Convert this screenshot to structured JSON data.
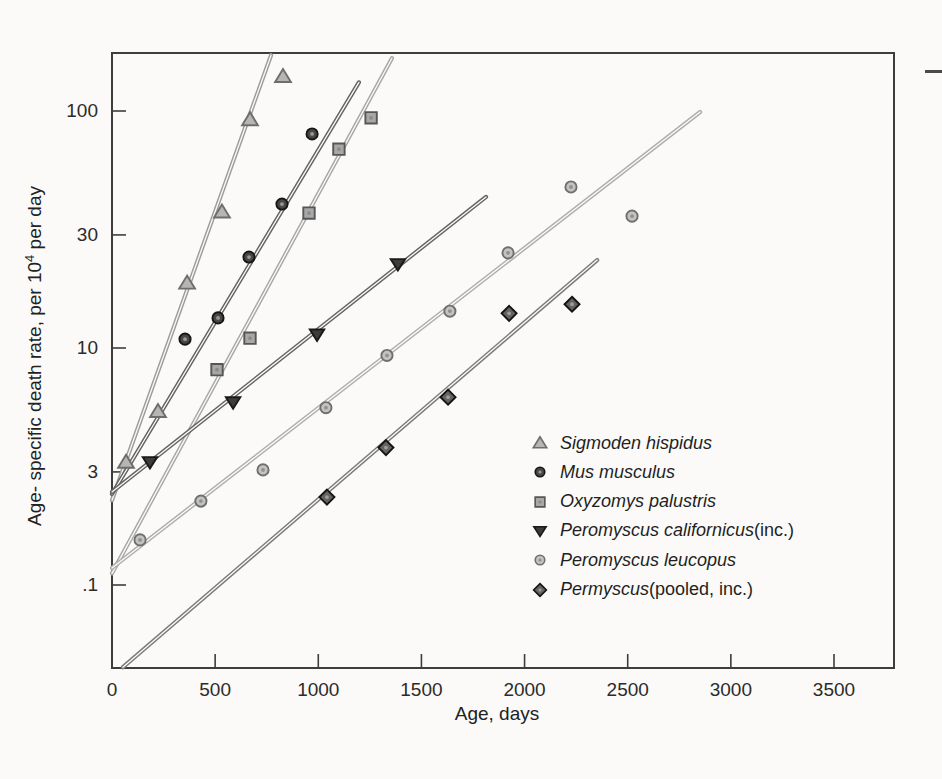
{
  "figure": {
    "background": "#fbfaf8",
    "frame_color": "#3d3d3d",
    "text_color": "#2b2b2b"
  },
  "chart_data": {
    "type": "scatter",
    "title": "",
    "xlabel": "Age, days",
    "ylabel": {
      "text_before_sup": "Age- specific death rate, per 10",
      "sup": "4",
      "text_after_sup": " per day"
    },
    "x_axis": {
      "ticks": [
        0,
        500,
        1000,
        1500,
        2000,
        2500,
        3000,
        3500
      ],
      "xlim": [
        0,
        3790
      ]
    },
    "y_axis": {
      "scale": "log",
      "ticks": [
        {
          "label": "100",
          "value": 100
        },
        {
          "label": "30",
          "value": 30
        },
        {
          "label": "10",
          "value": 10
        },
        {
          "label": "3",
          "value": 3
        },
        {
          "label": ".1",
          "value": 1
        }
      ],
      "ylim": [
        0.45,
        176
      ]
    },
    "grid": false,
    "legend_position": "inside lower right",
    "series": [
      {
        "id": "sigmodon",
        "name": "Sigmoden hispidus",
        "marker": "triangle-up",
        "line_color": "#9c9c9c",
        "fill": "#b5b5b5",
        "stroke": "#6d6d6d",
        "points": [
          [
            68,
            3.3
          ],
          [
            223,
            5.4
          ],
          [
            364,
            18.8
          ],
          [
            533,
            37.5
          ],
          [
            669,
            92
          ],
          [
            829,
            140
          ]
        ],
        "trend": {
          "x1": 0,
          "v1": 2.28,
          "x2": 771,
          "v2": 172
        }
      },
      {
        "id": "mus",
        "name": "Mus musculus",
        "marker": "circle",
        "line_color": "#636363",
        "fill": "#474747",
        "stroke": "#161616",
        "center_dot": "#999999",
        "points": [
          [
            354,
            10.9
          ],
          [
            514,
            13.4
          ],
          [
            664,
            24.2
          ],
          [
            824,
            40.5
          ],
          [
            970,
            80
          ]
        ],
        "trend": {
          "x1": 0,
          "v1": 2.42,
          "x2": 1197,
          "v2": 132
        }
      },
      {
        "id": "oxyzomys",
        "name": "Oxyzomys palustris",
        "marker": "square",
        "line_color": "#a8a8a8",
        "fill": "#a8a8a8",
        "stroke": "#565656",
        "center_dot": "#8b8b8b",
        "points": [
          [
            509,
            8.1
          ],
          [
            669,
            11.0
          ],
          [
            955,
            37.1
          ],
          [
            1100,
            69
          ],
          [
            1256,
            93.6
          ]
        ],
        "trend": {
          "x1": 0,
          "v1": 1.12,
          "x2": 1357,
          "v2": 167
        }
      },
      {
        "id": "californicus",
        "name": "Peromyscus californicus (inc.)",
        "marker": "triangle-down",
        "line_color": "#646464",
        "fill": "#3c3c3c",
        "stroke": "#191919",
        "points": [
          [
            184,
            3.3
          ],
          [
            587,
            5.9
          ],
          [
            994,
            11.4
          ],
          [
            1386,
            22.6
          ]
        ],
        "trend": {
          "x1": 0,
          "v1": 2.47,
          "x2": 1813,
          "v2": 43.4
        }
      },
      {
        "id": "leucopus",
        "name": "Peromyscus leucopus",
        "marker": "circle",
        "line_color": "#aeaeae",
        "fill": "#c3c3c3",
        "stroke": "#6f6f6f",
        "center_dot": "#919191",
        "points": [
          [
            136,
            1.55
          ],
          [
            431,
            2.26
          ],
          [
            732,
            3.06
          ],
          [
            1037,
            5.6
          ],
          [
            1333,
            9.3
          ],
          [
            1638,
            14.3
          ],
          [
            1920,
            25.2
          ],
          [
            2225,
            47.8
          ],
          [
            2521,
            36.0
          ]
        ],
        "trend": {
          "x1": 0,
          "v1": 1.18,
          "x2": 2851,
          "v2": 99
        }
      },
      {
        "id": "pooled",
        "name": "Permyscus (pooled, inc.)",
        "marker": "diamond",
        "line_color": "#7b7b7b",
        "fill": "#636363",
        "stroke": "#141414",
        "center_dot": "#9d9d9d",
        "points": [
          [
            1042,
            2.35
          ],
          [
            1328,
            3.8
          ],
          [
            1629,
            6.2
          ],
          [
            1925,
            14.0
          ],
          [
            2230,
            15.3
          ]
        ],
        "trend": {
          "x1": 53,
          "v1": 0.45,
          "x2": 2352,
          "v2": 23.5
        }
      }
    ]
  },
  "legend": {
    "items": [
      {
        "series": "sigmodon",
        "italic": "Sigmoden hispidus",
        "roman": ""
      },
      {
        "series": "mus",
        "italic": "Mus musculus",
        "roman": ""
      },
      {
        "series": "oxyzomys",
        "italic": "Oxyzomys palustris",
        "roman": ""
      },
      {
        "series": "californicus",
        "italic": "Peromyscus californicus",
        "roman": " (inc.)"
      },
      {
        "series": "leucopus",
        "italic": "Peromyscus leucopus",
        "roman": ""
      },
      {
        "series": "pooled",
        "italic": "Permyscus",
        "roman": " (pooled, inc.)"
      }
    ]
  }
}
